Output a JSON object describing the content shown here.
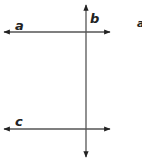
{
  "diagram": {
    "colors": {
      "line": "#555555",
      "arrow": "#222222",
      "label": "#222222",
      "background": "#ffffff"
    },
    "lines": [
      {
        "id": "a",
        "label": "a",
        "orientation": "horizontal",
        "x1": 4,
        "y1": 32,
        "x2": 110,
        "y2": 32,
        "label_x": 15,
        "label_y": 30
      },
      {
        "id": "b",
        "label": "b",
        "orientation": "vertical",
        "x1": 86,
        "y1": 5,
        "x2": 86,
        "y2": 157,
        "label_x": 90,
        "label_y": 23
      },
      {
        "id": "c",
        "label": "c",
        "orientation": "horizontal",
        "x1": 4,
        "y1": 129,
        "x2": 110,
        "y2": 129,
        "label_x": 15,
        "label_y": 126
      }
    ],
    "extra_label": {
      "text": "a",
      "x": 137,
      "y": 27
    }
  }
}
